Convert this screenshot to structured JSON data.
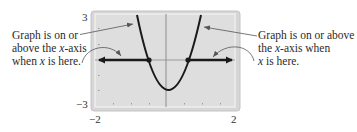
{
  "figure": {
    "annotation_left": {
      "lines": [
        "Graph is on or",
        "above the ",
        "x",
        "-axis",
        "when ",
        "x",
        " is here."
      ],
      "line1": "Graph is on or",
      "line2_pre": "above the ",
      "line2_var": "x",
      "line2_post": "-axis",
      "line3_pre": "when ",
      "line3_var": "x",
      "line3_post": " is here."
    },
    "annotation_right": {
      "line1": "Graph is on or above",
      "line2_pre": "the ",
      "line2_var": "x",
      "line2_post": "-axis when",
      "line3_var": "x",
      "line3_post": " is here."
    },
    "window": {
      "ymax_label": "3",
      "ymin_label": "−3",
      "xmin_label": "−2",
      "xmax_label": "2"
    },
    "colors": {
      "frame_outer": "#d4d4d4",
      "frame_inner": "#e0e0e0",
      "plot_bg": "#dcdcdc",
      "curve": "#1a1a1a",
      "axis": "#7a7a7a",
      "pointer": "#555555"
    }
  }
}
